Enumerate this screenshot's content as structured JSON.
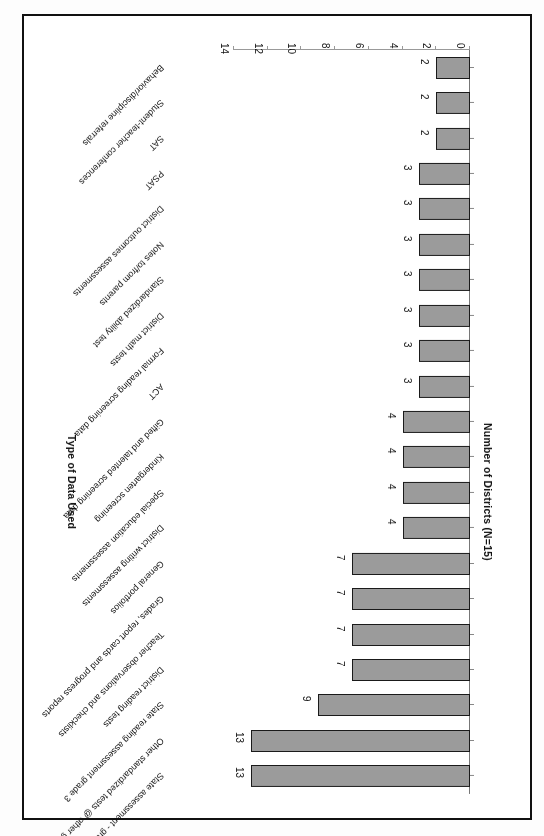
{
  "chart_data": {
    "type": "bar",
    "title": "",
    "xlabel": "Type of Data Used",
    "ylabel": "Number of Districts (N=15)",
    "ylim": [
      0,
      14
    ],
    "yticks": [
      0,
      2,
      4,
      6,
      8,
      10,
      12,
      14
    ],
    "grid": false,
    "legend": "none",
    "orientation": "vertical-rotated-180",
    "bar_color": "#9b9b9b",
    "bar_border_color": "#1a1a1a",
    "categories": [
      "State assessment - grades 4,8,10",
      "Other standardized tests @ other grade levels",
      "State reading assessment grade 3",
      "District reading tests",
      "Teacher observations and checklists",
      "Grades, report cards and progress reports",
      "General portfolios",
      "District writing assessments",
      "Special education assessments",
      "Kindergarten screening",
      "Gifted and talented screening data",
      "ACT",
      "Formal reading screening data",
      "District math tests",
      "Standardized ability test",
      "Notes to/from parents",
      "District outcomes assessments",
      "PSAT",
      "SAT",
      "Student-teacher conferences",
      "Behavior/discipline referrals"
    ],
    "values": [
      13,
      13,
      9,
      7,
      7,
      7,
      7,
      4,
      4,
      4,
      4,
      3,
      3,
      3,
      3,
      3,
      3,
      3,
      2,
      2,
      2
    ]
  }
}
